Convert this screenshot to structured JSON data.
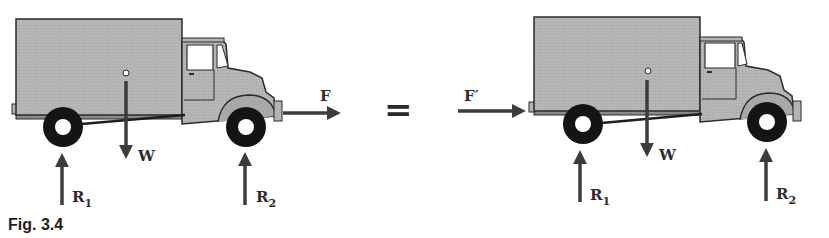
{
  "figure": {
    "caption": "Fig. 3.4",
    "equals_sign": "=",
    "colors": {
      "body_fill": "#b4b4b4",
      "outline": "#2a2a2a",
      "tire": "#141414",
      "arrow": "#3c3c3c",
      "window": "#ffffff"
    },
    "left_truck": {
      "forces": {
        "weight": "W",
        "applied_force": "F",
        "rear_reaction": "R",
        "rear_reaction_sub": "1",
        "front_reaction": "R",
        "front_reaction_sub": "2"
      }
    },
    "right_truck": {
      "forces": {
        "weight": "W",
        "applied_force": "F′",
        "rear_reaction": "R",
        "rear_reaction_sub": "1",
        "front_reaction": "R",
        "front_reaction_sub": "2"
      }
    }
  }
}
